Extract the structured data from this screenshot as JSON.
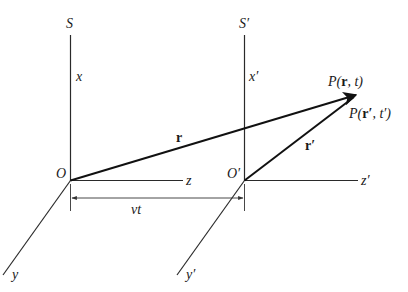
{
  "diagram": {
    "frame_S": {
      "name": "S",
      "origin": "O",
      "x_axis": "x",
      "y_axis": "y",
      "z_axis": "z"
    },
    "frame_S_prime": {
      "name": "S′",
      "origin": "O′",
      "x_axis": "x′",
      "y_axis": "y′",
      "z_axis": "z′"
    },
    "vectors": {
      "r": "r",
      "r_prime": "r′"
    },
    "point": {
      "label_unprimed_prefix": "P(",
      "label_unprimed_vec": "r",
      "label_unprimed_suffix": ", t)",
      "label_primed_prefix": "P(",
      "label_primed_vec": "r′",
      "label_primed_suffix": ", t′)"
    },
    "displacement": {
      "label": "vt"
    },
    "colors": {
      "line": "#2a2a2a",
      "vector": "#111111",
      "background": "#ffffff"
    }
  }
}
